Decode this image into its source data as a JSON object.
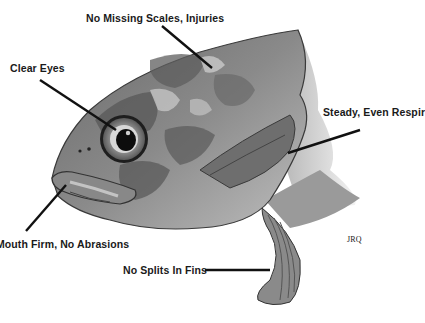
{
  "diagram": {
    "labels": [
      {
        "id": "scales",
        "text": "No Missing Scales, Injuries"
      },
      {
        "id": "eyes",
        "text": "Clear Eyes"
      },
      {
        "id": "respiration",
        "text": "Steady, Even Respir"
      },
      {
        "id": "mouth",
        "text": "Mouth Firm, No Abrasions"
      },
      {
        "id": "fins",
        "text": "No Splits In Fins"
      }
    ],
    "signature": "JRQ",
    "colors": {
      "line": "#111111",
      "fish_dark": "#4a4a4a",
      "fish_mid": "#7a7a7a",
      "fish_light": "#b5b5b5",
      "background": "#ffffff"
    }
  }
}
